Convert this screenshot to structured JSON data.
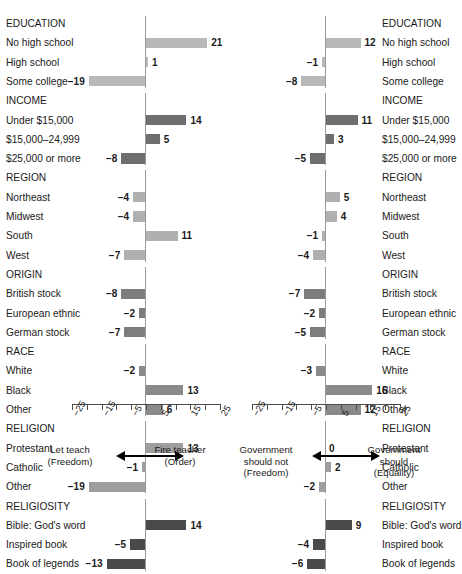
{
  "meta": {
    "cut_off_title": "",
    "panel_left_name": "tolerance-teacher-panel",
    "panel_right_name": "government-equality-panel"
  },
  "axis": {
    "min": -25,
    "max": 25,
    "tick_step": 5,
    "tick_labels": [
      "-25",
      "-15",
      "-5",
      "5",
      "15",
      "25"
    ],
    "tick_label_values": [
      -25,
      -15,
      -5,
      5,
      15,
      25
    ],
    "minor_tick_values": [
      -25,
      -20,
      -15,
      -10,
      -5,
      0,
      5,
      10,
      15,
      20,
      25
    ]
  },
  "anchors": {
    "left_panel": {
      "left_label_line1": "Let teach",
      "left_label_line2": "(Freedom)",
      "right_label_line1": "Fire teacher",
      "right_label_line2": "(Order)"
    },
    "right_panel": {
      "left_label_line1": "Government",
      "left_label_line2": "should not",
      "left_label_line3": "(Freedom)",
      "right_label_line1": "Government",
      "right_label_line2": "should",
      "right_label_line3": "(Equality)"
    }
  },
  "colors": {
    "EDUCATION": "#b8b8b8",
    "INCOME": "#6e6e6e",
    "REGION": "#b0b0b0",
    "ORIGIN": "#7d7d7d",
    "RACE": "#8a8a8a",
    "RELIGION": "#9e9e9e",
    "RELIGIOSITY": "#4a4a4a",
    "axis": "#4d4d4d",
    "zeroline": "#9a9a9a",
    "text": "#1a1a1a"
  },
  "chart_data": {
    "type": "bar",
    "orientation": "horizontal",
    "title": "",
    "xlabel": "",
    "ylabel": "",
    "xlim": [
      -25,
      25
    ],
    "grid": false,
    "legend_position": "none",
    "categories": [
      "EDUCATION",
      "No high school",
      "High school",
      "Some college",
      "INCOME",
      "Under $15,000",
      "$15,000–24,999",
      "$25,000 or more",
      "REGION",
      "Northeast",
      "Midwest",
      "South",
      "West",
      "ORIGIN",
      "British stock",
      "European ethnic",
      "German stock",
      "RACE",
      "White",
      "Black",
      "Other",
      "RELIGION",
      "Protestant",
      "Catholic",
      "Other",
      "RELIGIOSITY",
      "Bible: God's word",
      "Inspired book",
      "Book of legends"
    ],
    "rows": [
      {
        "label": "EDUCATION",
        "group": "EDUCATION",
        "header": true,
        "left": null,
        "right": null
      },
      {
        "label": "No high school",
        "group": "EDUCATION",
        "header": false,
        "left": 21,
        "right": 12
      },
      {
        "label": "High school",
        "group": "EDUCATION",
        "header": false,
        "left": 1,
        "right": -1
      },
      {
        "label": "Some college",
        "group": "EDUCATION",
        "header": false,
        "left": -19,
        "right": -8
      },
      {
        "label": "INCOME",
        "group": "INCOME",
        "header": true,
        "left": null,
        "right": null
      },
      {
        "label": "Under $15,000",
        "group": "INCOME",
        "header": false,
        "left": 14,
        "right": 11
      },
      {
        "label": "$15,000–24,999",
        "group": "INCOME",
        "header": false,
        "left": 5,
        "right": 3
      },
      {
        "label": "$25,000 or more",
        "group": "INCOME",
        "header": false,
        "left": -8,
        "right": -5
      },
      {
        "label": "REGION",
        "group": "REGION",
        "header": true,
        "left": null,
        "right": null
      },
      {
        "label": "Northeast",
        "group": "REGION",
        "header": false,
        "left": -4,
        "right": 5
      },
      {
        "label": "Midwest",
        "group": "REGION",
        "header": false,
        "left": -4,
        "right": 4
      },
      {
        "label": "South",
        "group": "REGION",
        "header": false,
        "left": 11,
        "right": -1
      },
      {
        "label": "West",
        "group": "REGION",
        "header": false,
        "left": -7,
        "right": -4
      },
      {
        "label": "ORIGIN",
        "group": "ORIGIN",
        "header": true,
        "left": null,
        "right": null
      },
      {
        "label": "British stock",
        "group": "ORIGIN",
        "header": false,
        "left": -8,
        "right": -7
      },
      {
        "label": "European ethnic",
        "group": "ORIGIN",
        "header": false,
        "left": -2,
        "right": -2
      },
      {
        "label": "German stock",
        "group": "ORIGIN",
        "header": false,
        "left": -7,
        "right": -5
      },
      {
        "label": "RACE",
        "group": "RACE",
        "header": true,
        "left": null,
        "right": null
      },
      {
        "label": "White",
        "group": "RACE",
        "header": false,
        "left": -2,
        "right": -3
      },
      {
        "label": "Black",
        "group": "RACE",
        "header": false,
        "left": 13,
        "right": 16
      },
      {
        "label": "Other",
        "group": "RACE",
        "header": false,
        "left": 6,
        "right": 12
      },
      {
        "label": "RELIGION",
        "group": "RELIGION",
        "header": true,
        "left": null,
        "right": null
      },
      {
        "label": "Protestant",
        "group": "RELIGION",
        "header": false,
        "left": 13,
        "right": 0
      },
      {
        "label": "Catholic",
        "group": "RELIGION",
        "header": false,
        "left": -1,
        "right": 2
      },
      {
        "label": "Other",
        "group": "RELIGION",
        "header": false,
        "left": -19,
        "right": -2
      },
      {
        "label": "RELIGIOSITY",
        "group": "RELIGIOSITY",
        "header": true,
        "left": null,
        "right": null
      },
      {
        "label": "Bible: God's word",
        "group": "RELIGIOSITY",
        "header": false,
        "left": 14,
        "right": 9
      },
      {
        "label": "Inspired book",
        "group": "RELIGIOSITY",
        "header": false,
        "left": -5,
        "right": -4
      },
      {
        "label": "Book of legends",
        "group": "RELIGIOSITY",
        "header": false,
        "left": -13,
        "right": -6
      }
    ]
  }
}
